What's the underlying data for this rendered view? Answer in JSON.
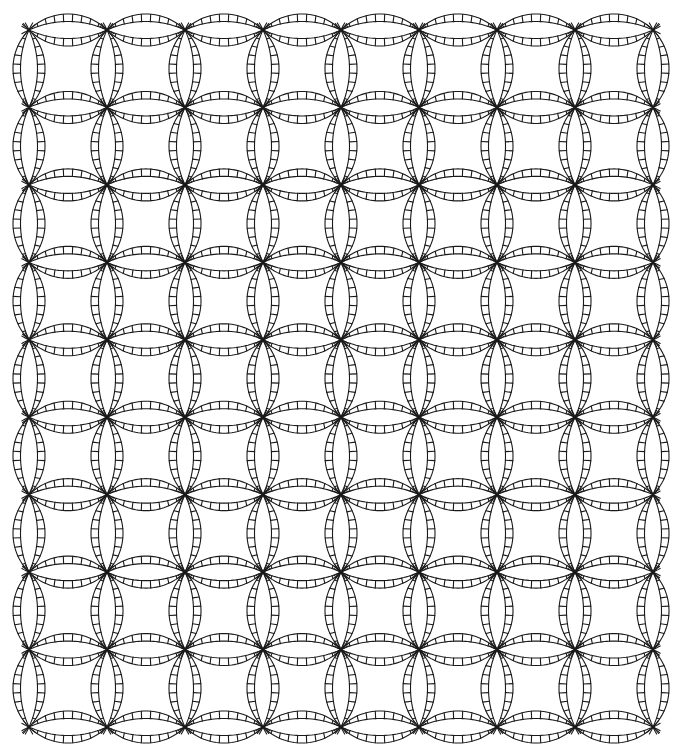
{
  "pattern": {
    "name": "Double Wedding Ring quilt pattern",
    "style": "line-drawing",
    "columns": 8,
    "rows": 9,
    "segments_per_arc": 7,
    "line_color": "#1a1a1a",
    "background_color": "#ffffff"
  }
}
